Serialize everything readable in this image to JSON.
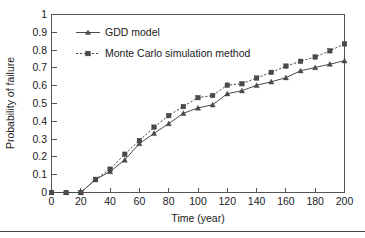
{
  "chart_data": {
    "type": "line",
    "title": "",
    "xlabel": "Time (year)",
    "ylabel": "Probability of failure",
    "xlim": [
      0,
      200
    ],
    "ylim": [
      0,
      1
    ],
    "grid": false,
    "legend_position": "top-left inside plot area",
    "x_ticks": [
      0,
      20,
      40,
      60,
      80,
      100,
      120,
      140,
      160,
      180,
      200
    ],
    "x_tick_labels": [
      "0",
      "20",
      "40",
      "60",
      "80",
      "100",
      "120",
      "140",
      "160",
      "180",
      "200"
    ],
    "y_ticks": [
      0,
      0.1,
      0.2,
      0.3,
      0.4,
      0.5,
      0.6,
      0.7,
      0.8,
      0.9,
      1
    ],
    "y_tick_labels": [
      "0",
      "0.1",
      "0.2",
      "0.3",
      "0.4",
      "0.5",
      "0.6",
      "0.7",
      "0.8",
      "0.9",
      "1"
    ],
    "x": [
      0,
      10,
      20,
      30,
      40,
      50,
      60,
      70,
      80,
      90,
      100,
      110,
      120,
      130,
      140,
      150,
      160,
      170,
      180,
      190,
      200
    ],
    "series": [
      {
        "name": "GDD model",
        "marker": "triangle",
        "line_style": "solid",
        "color": "#4a4a4a",
        "values": [
          0,
          0,
          0,
          0.072,
          0.118,
          0.183,
          0.275,
          0.332,
          0.387,
          0.445,
          0.475,
          0.493,
          0.555,
          0.572,
          0.602,
          0.622,
          0.645,
          0.684,
          0.702,
          0.721,
          0.74
        ]
      },
      {
        "name": "Monte Carlo simulation method",
        "marker": "square",
        "line_style": "dotted",
        "color": "#4a4a4a",
        "values": [
          0,
          0,
          0,
          0.074,
          0.131,
          0.215,
          0.292,
          0.367,
          0.432,
          0.483,
          0.533,
          0.545,
          0.603,
          0.611,
          0.643,
          0.675,
          0.71,
          0.737,
          0.761,
          0.796,
          0.835
        ]
      }
    ]
  },
  "legend": {
    "entries": [
      {
        "label": "GDD model"
      },
      {
        "label": "Monte Carlo simulation method"
      }
    ]
  },
  "axes": {
    "x_title": "Time (year)",
    "y_title": "Probability of failure"
  }
}
